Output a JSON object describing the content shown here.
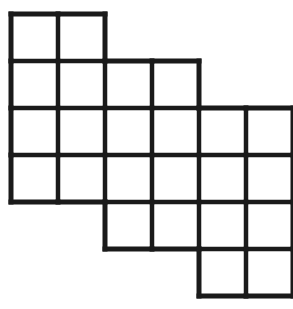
{
  "figure": {
    "name": "staircase-polyomino-grid",
    "type": "grid-diagram",
    "line_color": "#1a1a1a",
    "background_color": "#ffffff",
    "fill_color": "#ffffff",
    "stroke_width_outer": 5,
    "stroke_width_inner": 4.5,
    "cell_size": 47,
    "origin_x": 11,
    "origin_y": 14,
    "total_cells": 24,
    "columns": 6,
    "rows": 6,
    "row_spans": [
      {
        "row": 1,
        "start_col": 1,
        "end_col": 2,
        "count": 2
      },
      {
        "row": 2,
        "start_col": 1,
        "end_col": 4,
        "count": 4
      },
      {
        "row": 3,
        "start_col": 1,
        "end_col": 6,
        "count": 6
      },
      {
        "row": 4,
        "start_col": 1,
        "end_col": 6,
        "count": 6
      },
      {
        "row": 5,
        "start_col": 3,
        "end_col": 6,
        "count": 4
      },
      {
        "row": 6,
        "start_col": 5,
        "end_col": 6,
        "count": 2
      }
    ],
    "cells": [
      {
        "row": 1,
        "col": 1
      },
      {
        "row": 1,
        "col": 2
      },
      {
        "row": 2,
        "col": 1
      },
      {
        "row": 2,
        "col": 2
      },
      {
        "row": 2,
        "col": 3
      },
      {
        "row": 2,
        "col": 4
      },
      {
        "row": 3,
        "col": 1
      },
      {
        "row": 3,
        "col": 2
      },
      {
        "row": 3,
        "col": 3
      },
      {
        "row": 3,
        "col": 4
      },
      {
        "row": 3,
        "col": 5
      },
      {
        "row": 3,
        "col": 6
      },
      {
        "row": 4,
        "col": 1
      },
      {
        "row": 4,
        "col": 2
      },
      {
        "row": 4,
        "col": 3
      },
      {
        "row": 4,
        "col": 4
      },
      {
        "row": 4,
        "col": 5
      },
      {
        "row": 4,
        "col": 6
      },
      {
        "row": 5,
        "col": 3
      },
      {
        "row": 5,
        "col": 4
      },
      {
        "row": 5,
        "col": 5
      },
      {
        "row": 5,
        "col": 6
      },
      {
        "row": 6,
        "col": 5
      },
      {
        "row": 6,
        "col": 6
      }
    ]
  }
}
